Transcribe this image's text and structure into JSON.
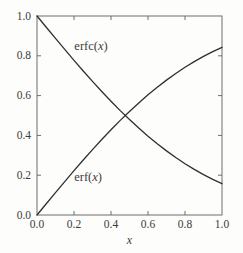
{
  "figure": {
    "background": "#fdfdfb",
    "frame_color": "#6e6e6e",
    "curve_color": "#2f2f2f",
    "text_color": "#3c3c3c"
  },
  "chart_data": {
    "type": "line",
    "title": "",
    "xlabel": "x",
    "ylabel": "",
    "xlim": [
      0,
      1
    ],
    "ylim": [
      0,
      1
    ],
    "grid": false,
    "legend": "none",
    "xticks": [
      0,
      0.2,
      0.4,
      0.6,
      0.8,
      1.0
    ],
    "xtick_labels": [
      "0.0",
      "0.2",
      "0.4",
      "0.6",
      "0.8",
      "1.0"
    ],
    "yticks": [
      0,
      0.2,
      0.4,
      0.6,
      0.8,
      1.0
    ],
    "ytick_labels": [
      "0.0",
      "0.2",
      "0.4",
      "0.6",
      "0.8",
      "1.0"
    ],
    "x": [
      0,
      0.05,
      0.1,
      0.15,
      0.2,
      0.25,
      0.3,
      0.35,
      0.4,
      0.45,
      0.5,
      0.55,
      0.6,
      0.65,
      0.7,
      0.75,
      0.8,
      0.85,
      0.9,
      0.95,
      1
    ],
    "series": [
      {
        "id": "erf",
        "name": "erf(x)",
        "values": [
          0,
          0.0564,
          0.1125,
          0.168,
          0.2227,
          0.2763,
          0.3286,
          0.3794,
          0.4284,
          0.4755,
          0.5205,
          0.5633,
          0.6039,
          0.642,
          0.6778,
          0.7112,
          0.7421,
          0.7707,
          0.7969,
          0.8209,
          0.8427
        ]
      },
      {
        "id": "erfc",
        "name": "erfc(x)",
        "values": [
          1,
          0.9436,
          0.8875,
          0.832,
          0.7773,
          0.7237,
          0.6714,
          0.6206,
          0.5716,
          0.5245,
          0.4795,
          0.4367,
          0.3961,
          0.358,
          0.3222,
          0.2888,
          0.2579,
          0.2293,
          0.2031,
          0.1791,
          0.1573
        ]
      }
    ],
    "annotations": [
      {
        "id": "erfc-label",
        "prefix": "erfc(",
        "var": "x",
        "suffix": ")",
        "x": 0.292,
        "y": 0.852
      },
      {
        "id": "erf-label",
        "prefix": "erf(",
        "var": "x",
        "suffix": ")",
        "x": 0.276,
        "y": 0.193
      }
    ],
    "crossing_point": {
      "x": 0.477,
      "y": 0.5
    }
  }
}
